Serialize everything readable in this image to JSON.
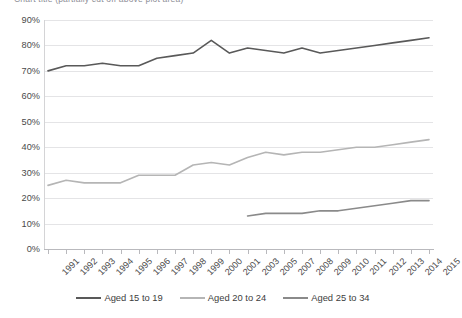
{
  "title_clipped": "Chart title (partially cut off above plot area)",
  "legend": {
    "position": "bottom-center",
    "items": [
      {
        "label": "Aged 15 to 19",
        "color": "#595959"
      },
      {
        "label": "Aged 20 to 24",
        "color": "#b5b5b5"
      },
      {
        "label": "Aged 25 to 34",
        "color": "#8a8a8a"
      }
    ]
  },
  "axes": {
    "y_ticks": [
      "90%",
      "80%",
      "70%",
      "60%",
      "50%",
      "40%",
      "30%",
      "20%",
      "10%",
      "0%"
    ],
    "x_ticks": [
      "1991",
      "1992",
      "1993",
      "1994",
      "1995",
      "1996",
      "1997",
      "1998",
      "1999",
      "2000",
      "2001",
      "2003",
      "2005",
      "2007",
      "2008",
      "2009",
      "2010",
      "2011",
      "2012",
      "2013",
      "2014",
      "2015"
    ]
  },
  "chart_data": {
    "type": "line",
    "title": "",
    "subtitle": "",
    "xlabel": "",
    "ylabel": "",
    "ylim": [
      0,
      90
    ],
    "ytick_step": 10,
    "ytick_format": "percent",
    "grid": true,
    "legend_position": "bottom",
    "x": [
      "1991",
      "1992",
      "1993",
      "1994",
      "1995",
      "1996",
      "1997",
      "1998",
      "1999",
      "2000",
      "2001",
      "2003",
      "2005",
      "2007",
      "2008",
      "2009",
      "2010",
      "2011",
      "2012",
      "2013",
      "2014",
      "2015"
    ],
    "series": [
      {
        "name": "Aged 15 to 19",
        "color": "#595959",
        "values": [
          70,
          72,
          72,
          73,
          72,
          72,
          75,
          76,
          77,
          82,
          77,
          79,
          78,
          77,
          79,
          77,
          78,
          79,
          80,
          81,
          82,
          83
        ]
      },
      {
        "name": "Aged 20 to 24",
        "color": "#b5b5b5",
        "values": [
          25,
          27,
          26,
          26,
          26,
          29,
          29,
          29,
          33,
          34,
          33,
          36,
          38,
          37,
          38,
          38,
          39,
          40,
          40,
          41,
          42,
          43
        ]
      },
      {
        "name": "Aged 25 to 34",
        "color": "#8a8a8a",
        "values": [
          null,
          null,
          null,
          null,
          null,
          null,
          null,
          null,
          null,
          null,
          null,
          13,
          14,
          14,
          14,
          15,
          15,
          16,
          17,
          18,
          19,
          19
        ]
      }
    ]
  }
}
